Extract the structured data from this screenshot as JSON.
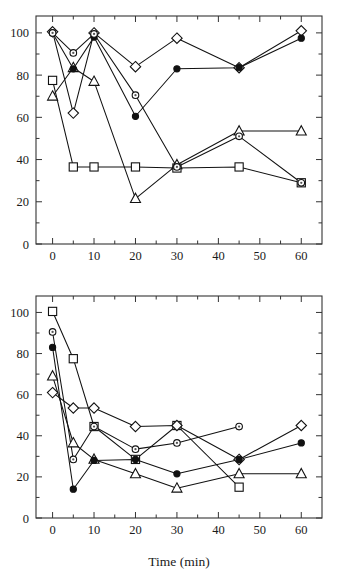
{
  "figure": {
    "panels": [
      "top",
      "bottom"
    ],
    "shared_xlabel": "Time (min)"
  },
  "chart_data": [
    {
      "panel": "top",
      "type": "line",
      "title": "",
      "subtitle": "",
      "xlabel": "",
      "ylabel": "",
      "xlim": [
        -4,
        65
      ],
      "ylim": [
        0,
        108
      ],
      "xticks": [
        0,
        10,
        20,
        30,
        40,
        50,
        60
      ],
      "xticklabels": [
        "0",
        "10",
        "20",
        "30",
        "40",
        "50",
        "60"
      ],
      "yticks": [
        0,
        20,
        40,
        60,
        80,
        100
      ],
      "yticklabels": [
        "0",
        "20",
        "40",
        "60",
        "80",
        "100"
      ],
      "x_minor_ticks": [
        5,
        15,
        25,
        35,
        45,
        55
      ],
      "y_minor_ticks": [
        10,
        30,
        50,
        70,
        90
      ],
      "grid": false,
      "legend": "none",
      "x": [
        0,
        5,
        10,
        20,
        30,
        45,
        60
      ],
      "series": [
        {
          "name": "open-square",
          "marker": "square",
          "filled": false,
          "values": [
            77.5,
            36.5,
            36.5,
            36.5,
            36.0,
            36.5,
            29.0
          ]
        },
        {
          "name": "open-diamond",
          "marker": "diamond",
          "filled": false,
          "values": [
            100.5,
            62.0,
            100.0,
            84.0,
            97.5,
            83.5,
            101.0
          ]
        },
        {
          "name": "open-triangle",
          "marker": "triangle",
          "filled": false,
          "values": [
            70.0,
            83.5,
            77.0,
            21.5,
            37.5,
            53.5,
            53.5
          ]
        },
        {
          "name": "filled-circle",
          "marker": "circle",
          "filled": true,
          "values": [
            100.0,
            83.0,
            98.0,
            60.5,
            83.0,
            83.5,
            97.5
          ]
        },
        {
          "name": "open-circle-dot",
          "marker": "circle-dot",
          "filled": false,
          "values": [
            100.0,
            90.5,
            99.5,
            70.5,
            36.5,
            51.0,
            29.0
          ]
        }
      ]
    },
    {
      "panel": "bottom",
      "type": "line",
      "title": "",
      "subtitle": "",
      "xlabel": "Time (min)",
      "ylabel": "",
      "xlim": [
        -4,
        65
      ],
      "ylim": [
        0,
        108
      ],
      "xticks": [
        0,
        10,
        20,
        30,
        40,
        50,
        60
      ],
      "xticklabels": [
        "0",
        "10",
        "20",
        "30",
        "40",
        "50",
        "60"
      ],
      "yticks": [
        0,
        20,
        40,
        60,
        80,
        100
      ],
      "yticklabels": [
        "0",
        "20",
        "40",
        "60",
        "80",
        "100"
      ],
      "x_minor_ticks": [
        5,
        15,
        25,
        35,
        45,
        55
      ],
      "y_minor_ticks": [
        10,
        30,
        50,
        70,
        90
      ],
      "grid": false,
      "legend": "none",
      "x": [
        0,
        5,
        10,
        20,
        30,
        45,
        60
      ],
      "series": [
        {
          "name": "open-square",
          "marker": "square",
          "filled": false,
          "values": [
            100.5,
            77.5,
            44.5,
            28.5,
            45.0,
            15.0,
            null
          ]
        },
        {
          "name": "open-diamond",
          "marker": "diamond",
          "filled": false,
          "values": [
            61.0,
            53.5,
            53.5,
            44.5,
            45.0,
            28.5,
            45.0
          ]
        },
        {
          "name": "open-triangle",
          "marker": "triangle",
          "filled": false,
          "values": [
            69.0,
            36.5,
            28.5,
            21.5,
            14.5,
            21.5,
            21.5
          ]
        },
        {
          "name": "filled-circle",
          "marker": "circle",
          "filled": true,
          "values": [
            83.0,
            14.0,
            28.0,
            28.5,
            21.5,
            28.5,
            36.5
          ]
        },
        {
          "name": "open-circle-dot",
          "marker": "circle-dot",
          "filled": false,
          "values": [
            90.5,
            28.5,
            44.5,
            33.5,
            36.5,
            44.5,
            null
          ]
        }
      ]
    }
  ]
}
